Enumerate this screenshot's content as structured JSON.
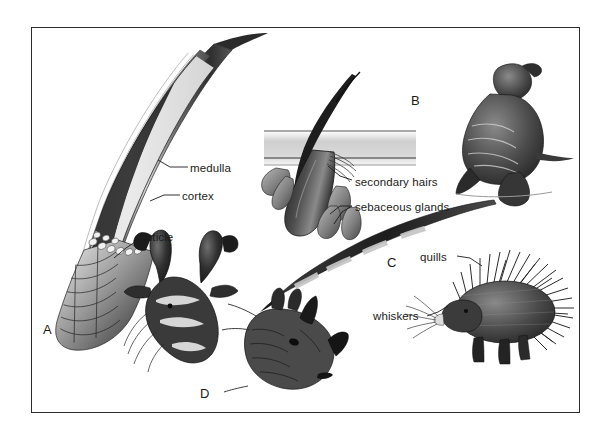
{
  "figure": {
    "background_color": "#ffffff",
    "frame_color": "#2b2b2b",
    "ink_color": "#1b1b1b",
    "width": 614,
    "height": 440
  },
  "panels": [
    {
      "letter": "A",
      "subject": "hair-shaft-cross-section",
      "description": "Curved guard hair shown in longitudinal section with layered internal structure",
      "labels": [
        "medulla",
        "cortex",
        "cuticle"
      ]
    },
    {
      "letter": "B",
      "subject": "hair-follicle-in-skin",
      "description": "Hair follicle piercing a skin section with accessory structures, beside a fur seal",
      "labels": [
        "secondary hairs",
        "sebaceous glands"
      ]
    },
    {
      "letter": "C",
      "subject": "quill-and-porcupine",
      "description": "Single banded quill beside a porcupine",
      "labels": [
        "quills",
        "whiskers"
      ]
    },
    {
      "letter": "D",
      "subject": "horns-pronghorn-rhinoceros",
      "description": "Pronghorn antelope head and rhinoceros head showing keratin horns",
      "labels": []
    }
  ],
  "callouts": {
    "medulla": "medulla",
    "cortex": "cortex",
    "cuticle": "cuticle",
    "secondary_hairs": "secondary hairs",
    "sebaceous_glands": "sebaceous glands",
    "quills": "quills",
    "whiskers": "whiskers"
  },
  "panel_letters": {
    "a": "A",
    "b": "B",
    "c": "C",
    "d": "D"
  }
}
